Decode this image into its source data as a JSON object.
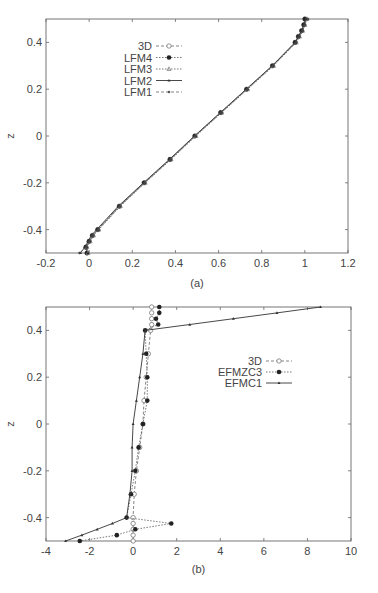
{
  "chart_data": [
    {
      "type": "line",
      "id": "a",
      "caption": "(a)",
      "title": "",
      "xlabel": "",
      "ylabel": "z",
      "xlim": [
        -0.2,
        1.2
      ],
      "ylim": [
        -0.5,
        0.5
      ],
      "xticks": [
        -0.2,
        0,
        0.2,
        0.4,
        0.6,
        0.8,
        1,
        1.2
      ],
      "xtick_labels": [
        "-0.2",
        "0",
        "0.2",
        "0.4",
        "0.6",
        "0.8",
        "1",
        "1.2"
      ],
      "yticks": [
        -0.4,
        -0.2,
        0,
        0.2,
        0.4
      ],
      "ytick_labels": [
        "-0.4",
        "-0.2",
        "0",
        "0.2",
        "0.4"
      ],
      "grid": false,
      "legend_position": "upper-left-inside",
      "z": [
        0.5,
        0.475,
        0.45,
        0.425,
        0.4,
        0.3,
        0.2,
        0.1,
        0.0,
        -0.1,
        -0.2,
        -0.3,
        -0.4,
        -0.425,
        -0.45,
        -0.475,
        -0.5
      ],
      "series": [
        {
          "name": "3D",
          "marker": "open-circle",
          "line": "dashed",
          "x": [
            1.0,
            0.995,
            0.985,
            0.97,
            0.955,
            0.85,
            0.73,
            0.61,
            0.49,
            0.375,
            0.255,
            0.14,
            0.04,
            0.015,
            0.0,
            -0.015,
            -0.01
          ]
        },
        {
          "name": "LFM4",
          "marker": "filled-circle",
          "line": "dotted",
          "x": [
            1.0,
            0.995,
            0.985,
            0.97,
            0.955,
            0.85,
            0.73,
            0.61,
            0.49,
            0.375,
            0.255,
            0.14,
            0.04,
            0.015,
            0.0,
            -0.015,
            -0.01
          ]
        },
        {
          "name": "LFM3",
          "marker": "open-triangle",
          "line": "dotted",
          "x": [
            1.01,
            1.0,
            0.99,
            0.975,
            0.96,
            0.855,
            0.735,
            0.615,
            0.495,
            0.38,
            0.26,
            0.145,
            0.045,
            0.02,
            0.005,
            -0.01,
            -0.005
          ]
        },
        {
          "name": "LFM2",
          "marker": "small-triangle",
          "line": "solid",
          "x": [
            1.005,
            0.995,
            0.985,
            0.97,
            0.955,
            0.848,
            0.728,
            0.608,
            0.488,
            0.372,
            0.252,
            0.135,
            0.035,
            0.01,
            -0.005,
            -0.02,
            -0.04
          ]
        },
        {
          "name": "LFM1",
          "marker": "small-diamond",
          "line": "dashed",
          "x": [
            1.015,
            1.0,
            0.99,
            0.975,
            0.96,
            0.852,
            0.732,
            0.612,
            0.492,
            0.377,
            0.257,
            0.142,
            0.042,
            0.017,
            0.002,
            -0.013,
            -0.045
          ]
        }
      ]
    },
    {
      "type": "line",
      "id": "b",
      "caption": "(b)",
      "title": "",
      "xlabel": "",
      "ylabel": "z",
      "xlim": [
        -4,
        10
      ],
      "ylim": [
        -0.5,
        0.5
      ],
      "xticks": [
        -4,
        -2,
        0,
        2,
        4,
        6,
        8,
        10
      ],
      "xtick_labels": [
        "-4",
        "-2",
        "0",
        "2",
        "4",
        "6",
        "8",
        "10"
      ],
      "yticks": [
        -0.4,
        -0.2,
        0,
        0.2,
        0.4
      ],
      "ytick_labels": [
        "-0.4",
        "-0.2",
        "0",
        "0.2",
        "0.4"
      ],
      "grid": false,
      "legend_position": "upper-right-inside",
      "z": [
        0.5,
        0.475,
        0.45,
        0.425,
        0.4,
        0.3,
        0.2,
        0.1,
        0.0,
        -0.1,
        -0.2,
        -0.3,
        -0.4,
        -0.425,
        -0.45,
        -0.475,
        -0.5
      ],
      "series": [
        {
          "name": "3D",
          "marker": "open-circle",
          "line": "dashed",
          "x": [
            0.85,
            0.85,
            0.85,
            0.85,
            0.8,
            0.7,
            0.6,
            0.5,
            0.45,
            0.3,
            0.15,
            0.05,
            0.0,
            0.0,
            0.0,
            0.0,
            0.0
          ]
        },
        {
          "name": "EFMZC3",
          "marker": "filled-circle",
          "line": "dotted",
          "x": [
            1.2,
            1.2,
            1.05,
            1.15,
            0.55,
            0.6,
            0.65,
            0.65,
            0.45,
            0.25,
            0.1,
            -0.1,
            -0.3,
            1.75,
            0.1,
            -0.75,
            -2.45
          ]
        },
        {
          "name": "EFMC1",
          "marker": "small-triangle",
          "line": "solid",
          "x": [
            8.6,
            6.6,
            4.6,
            2.6,
            0.55,
            0.45,
            0.3,
            0.15,
            0.0,
            -0.05,
            -0.05,
            -0.15,
            -0.3,
            -0.95,
            -1.65,
            -2.35,
            -3.1
          ]
        }
      ]
    }
  ]
}
